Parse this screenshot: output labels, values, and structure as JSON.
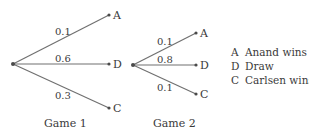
{
  "diagram": {
    "type": "probability-tree",
    "games": [
      {
        "caption": "Game 1",
        "branches": [
          {
            "prob": "0.1",
            "outcome": "A"
          },
          {
            "prob": "0.6",
            "outcome": "D"
          },
          {
            "prob": "0.3",
            "outcome": "C"
          }
        ]
      },
      {
        "caption": "Game 2",
        "branches": [
          {
            "prob": "0.1",
            "outcome": "A"
          },
          {
            "prob": "0.8",
            "outcome": "D"
          },
          {
            "prob": "0.1",
            "outcome": "C"
          }
        ]
      }
    ],
    "legend": [
      {
        "key": "A",
        "label": "Anand wins"
      },
      {
        "key": "D",
        "label": "Draw"
      },
      {
        "key": "C",
        "label": "Carlsen wins"
      }
    ],
    "colors": {
      "line": "#707070",
      "node": "#4a4a4a",
      "text": "#3a3a3a"
    }
  }
}
